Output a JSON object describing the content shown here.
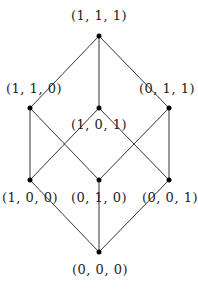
{
  "diagram": {
    "nodes": [
      {
        "id": "111",
        "label": "(1, 1, 1)"
      },
      {
        "id": "110",
        "label": "(1, 1, 0)"
      },
      {
        "id": "101",
        "label": "(1, 0, 1)"
      },
      {
        "id": "011",
        "label": "(0, 1, 1)"
      },
      {
        "id": "100",
        "label": "(1, 0, 0)"
      },
      {
        "id": "010",
        "label": "(0, 1, 0)"
      },
      {
        "id": "001",
        "label": "(0, 0, 1)"
      },
      {
        "id": "000",
        "label": "(0, 0, 0)"
      }
    ],
    "edges": [
      [
        "111",
        "110"
      ],
      [
        "111",
        "101"
      ],
      [
        "111",
        "011"
      ],
      [
        "110",
        "100"
      ],
      [
        "110",
        "010"
      ],
      [
        "101",
        "100"
      ],
      [
        "101",
        "001"
      ],
      [
        "011",
        "010"
      ],
      [
        "011",
        "001"
      ],
      [
        "100",
        "000"
      ],
      [
        "010",
        "000"
      ],
      [
        "001",
        "000"
      ]
    ],
    "colors": {
      "line": "#333333",
      "node": "#000000"
    }
  }
}
